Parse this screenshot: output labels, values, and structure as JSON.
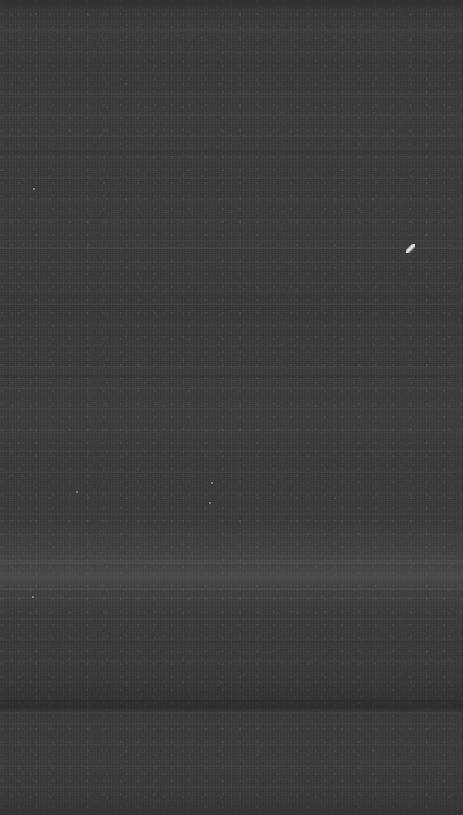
{
  "capture": {
    "width": 463,
    "height": 815,
    "description": "blank-dark-screen-capture",
    "visible_text": "",
    "readable_ui_elements": "none"
  },
  "appearance": {
    "base_color": "#3a3a3a",
    "darkest_color": "#2f2f2f",
    "lightest_color": "#4a4a4a",
    "top_edge_color": "#343434",
    "bottom_edge_color": "#363636",
    "texture": "horizontal-scanline-noise",
    "accent_color": "#f0f0f0"
  },
  "bands": [
    {
      "name": "top-dark-strip",
      "top": 0,
      "height": 5,
      "color": "#2f2f2f",
      "opacity": 0.55
    },
    {
      "name": "upper-light-band",
      "top": 28,
      "height": 3,
      "color": "#4a4a4a",
      "opacity": 0.3
    },
    {
      "name": "upper-mid-band",
      "top": 96,
      "height": 2,
      "color": "#464646",
      "opacity": 0.26
    },
    {
      "name": "mid-band-a",
      "top": 150,
      "height": 4,
      "color": "#333333",
      "opacity": 0.3
    },
    {
      "name": "cursor-row-line",
      "top": 247,
      "height": 2,
      "color": "#4e4e4e",
      "opacity": 0.34
    },
    {
      "name": "mid-band-b",
      "top": 290,
      "height": 3,
      "color": "#454545",
      "opacity": 0.22
    },
    {
      "name": "mid-band-c",
      "top": 375,
      "height": 3,
      "color": "#333333",
      "opacity": 0.26
    },
    {
      "name": "mid-band-d",
      "top": 432,
      "height": 2,
      "color": "#484848",
      "opacity": 0.22
    },
    {
      "name": "bright-band-upper",
      "top": 560,
      "height": 4,
      "color": "#555555",
      "opacity": 0.34
    },
    {
      "name": "bright-band-core",
      "top": 572,
      "height": 8,
      "color": "#4e4e4e",
      "opacity": 0.3
    },
    {
      "name": "bright-band-hairline",
      "top": 588,
      "height": 2,
      "color": "#5a5a5a",
      "opacity": 0.4
    },
    {
      "name": "lower-dark-band",
      "top": 640,
      "height": 3,
      "color": "#323232",
      "opacity": 0.3
    },
    {
      "name": "deep-dark-band",
      "top": 700,
      "height": 9,
      "color": "#2b2b2b",
      "opacity": 0.45
    },
    {
      "name": "deep-dark-hairline",
      "top": 712,
      "height": 2,
      "color": "#565656",
      "opacity": 0.28
    },
    {
      "name": "lower-light-band",
      "top": 760,
      "height": 3,
      "color": "#464646",
      "opacity": 0.22
    },
    {
      "name": "bottom-edge-band",
      "top": 805,
      "height": 10,
      "color": "#343434",
      "opacity": 0.35
    }
  ],
  "specks": [
    {
      "name": "cursor-artifact",
      "x": 406,
      "y": 244,
      "type": "cursor"
    },
    {
      "name": "speck-left-mid",
      "x": 76,
      "y": 491,
      "type": "dot"
    },
    {
      "name": "speck-left-low",
      "x": 32,
      "y": 596,
      "type": "dot"
    },
    {
      "name": "speck-mid-low",
      "x": 211,
      "y": 482,
      "type": "dot"
    },
    {
      "name": "speck-center",
      "x": 209,
      "y": 502,
      "type": "dot"
    },
    {
      "name": "speck-upper",
      "x": 33,
      "y": 188,
      "type": "dot"
    }
  ]
}
